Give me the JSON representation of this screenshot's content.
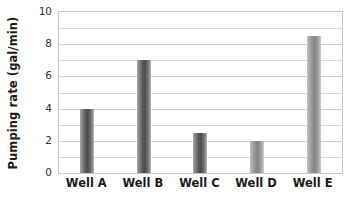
{
  "chart_data": {
    "type": "bar",
    "title": "",
    "subtitle": "",
    "xlabel": "",
    "ylabel": "Pumping rate (gal/min)",
    "categories": [
      "Well A",
      "Well B",
      "Well C",
      "Well D",
      "Well E"
    ],
    "values": [
      4.0,
      7.0,
      2.5,
      2.0,
      8.5
    ],
    "series": [
      {
        "name": "Pumping rate",
        "values": [
          4.0,
          7.0,
          2.5,
          2.0,
          8.5
        ]
      }
    ],
    "ylim": [
      0,
      10
    ],
    "xlim": null,
    "y_major_ticks": [
      0,
      2,
      4,
      6,
      8,
      10
    ],
    "y_tick_labels": [
      "0",
      "2",
      "4",
      "6",
      "8",
      "10"
    ],
    "y_minor_gridlines": [
      1,
      3,
      5,
      7,
      9
    ],
    "grid": true,
    "grid_axis": "y",
    "legend": false,
    "legend_position": "none",
    "annotations": [],
    "bar_styles": [
      "dark",
      "dark",
      "dark",
      "light",
      "light"
    ],
    "colors": {
      "bar_dark_center": "#4d4d4d",
      "bar_dark_edge": "#b5b5b5",
      "bar_light_center": "#858585",
      "bar_light_edge": "#cfcfcf",
      "gridline": "#d9d9d9",
      "axis_border": "#c9c9c9",
      "plot_background": "#ffffff",
      "text": "#1a1a1a"
    }
  }
}
